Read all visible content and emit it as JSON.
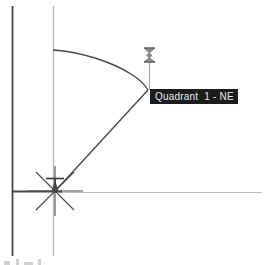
{
  "app": {
    "canvas_name": "cad-drawing-canvas",
    "background_color": "#ffffff"
  },
  "colors": {
    "axis_dark": "#3f3f3f",
    "axis_light": "#b9b9b9",
    "geometry": "#4a4a4a",
    "tooltip_bg": "#1c1c1c",
    "tooltip_text": "#e8e8e8",
    "cursor": "#9a9a9a"
  },
  "tooltip": {
    "label": "Quadrant  1 - NE",
    "x": 150,
    "y": 89,
    "width": 98,
    "height": 15
  },
  "cursor": {
    "icon": "hourglass-cursor-icon",
    "x": 149,
    "y": 52,
    "leader_top": 60,
    "leader_bottom": 90
  },
  "geometry": {
    "origin": {
      "x": 55,
      "y": 191
    },
    "arc": {
      "radius": 141,
      "start": {
        "x": 53,
        "y": 50
      },
      "end": {
        "x": 148,
        "y": 90
      },
      "path": "M 53 50 Q 100 56 131 74 Q 142 81 148 90"
    },
    "radius_line": {
      "x1": 58,
      "y1": 188,
      "x2": 148,
      "y2": 90
    },
    "star_marker": {
      "name": "survey-point-star-marker",
      "rays": 8,
      "length": 28
    },
    "point_marker": {
      "name": "survey-tack-marker",
      "x": 55,
      "y": 178
    }
  },
  "axes": {
    "vertical_dark": {
      "x": 12,
      "y1": 6,
      "y2": 256
    },
    "vertical_light": {
      "x": 53,
      "y1": 6,
      "y2": 256
    },
    "horizontal_dark": {
      "y": 191,
      "x1": 12,
      "x2": 60
    },
    "horizontal_light": {
      "y": 192,
      "x1": 60,
      "x2": 262
    }
  },
  "artifacts": {
    "bottom_left_mark": "partial-glyph-cutoff"
  }
}
